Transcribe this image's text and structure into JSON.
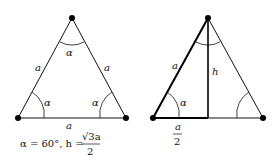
{
  "diagram": {
    "left_triangle": {
      "side_labels": {
        "left": "a",
        "right": "a",
        "bottom": "a"
      },
      "angle_labels": {
        "top": "α",
        "bottom_left": "α",
        "bottom_right": "α"
      },
      "formula": {
        "prefix": "α = 60°, h = ",
        "numerator": "√3a",
        "denominator": "2"
      }
    },
    "right_triangle": {
      "side_label_left": "a",
      "height_label": "h",
      "angle_label_bottom_left": "α",
      "half_base": {
        "numerator": "a",
        "denominator": "2"
      }
    },
    "colors": {
      "stroke": "#111111",
      "vertex": "#000000"
    }
  }
}
